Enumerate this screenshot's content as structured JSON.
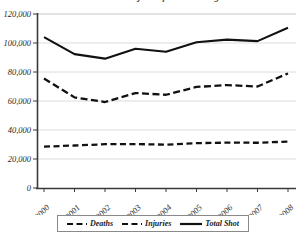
{
  "chart": {
    "title_fragment": "Deaths and Injuries from Shootings",
    "grid": true,
    "legend_position": "bottom"
  },
  "axes": {
    "ylabel": "",
    "xlabel": "",
    "y_ticks": [
      "0",
      "20,000",
      "40,000",
      "60,000",
      "80,000",
      "100,000",
      "120,000"
    ],
    "x_ticks": [
      "2000",
      "2001",
      "2002",
      "2003",
      "2004",
      "2005",
      "2006",
      "2007",
      "2008"
    ]
  },
  "legend": {
    "items": [
      {
        "label": "Deaths",
        "style": "dashed",
        "color": "#111111"
      },
      {
        "label": "Injuries",
        "style": "dashed",
        "color": "#111111"
      },
      {
        "label": "Total Shot",
        "style": "solid",
        "color": "#111111"
      }
    ]
  },
  "chart_data": {
    "type": "line",
    "title": "Deaths and Injuries from Shootings",
    "xlabel": "",
    "ylabel": "",
    "categories": [
      "2000",
      "2001",
      "2002",
      "2003",
      "2004",
      "2005",
      "2006",
      "2007",
      "2008"
    ],
    "ylim": [
      0,
      120000
    ],
    "ytick_step": 20000,
    "grid": true,
    "legend_position": "bottom",
    "series": [
      {
        "name": "Deaths",
        "style": "dashed",
        "color": "#111111",
        "values": [
          28500,
          29300,
          30200,
          30300,
          29900,
          30900,
          31300,
          31200,
          32000
        ]
      },
      {
        "name": "Injuries",
        "style": "dashed",
        "color": "#111111",
        "values": [
          75500,
          62500,
          59300,
          65500,
          64300,
          69700,
          71000,
          70000,
          79000
        ]
      },
      {
        "name": "Total Shot",
        "style": "solid",
        "color": "#111111",
        "values": [
          104000,
          92300,
          89200,
          96000,
          94000,
          100500,
          102300,
          101300,
          110500
        ]
      }
    ]
  }
}
